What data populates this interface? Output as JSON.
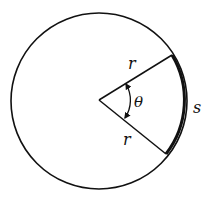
{
  "diagram": {
    "labels": {
      "radius_upper": "r",
      "radius_lower": "r",
      "angle": "θ",
      "arc": "s"
    },
    "colors": {
      "stroke": "#111111",
      "background": "#ffffff"
    }
  }
}
